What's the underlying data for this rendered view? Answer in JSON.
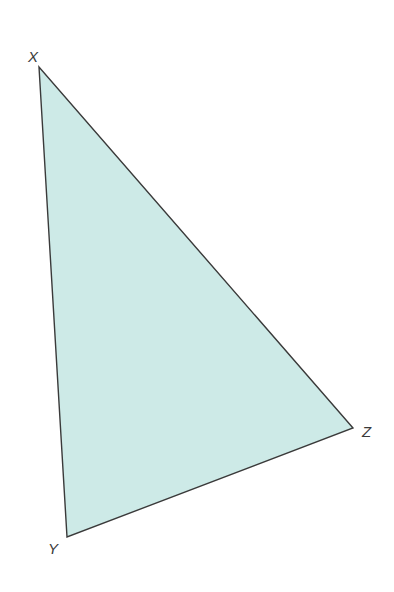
{
  "figure": {
    "type": "triangle",
    "fill_color": "#cdeae7",
    "stroke_color": "#3a3a3a",
    "vertices": [
      {
        "label": "X",
        "x": 39,
        "y": 67
      },
      {
        "label": "Y",
        "x": 67,
        "y": 537
      },
      {
        "label": "Z",
        "x": 353,
        "y": 428
      }
    ]
  }
}
